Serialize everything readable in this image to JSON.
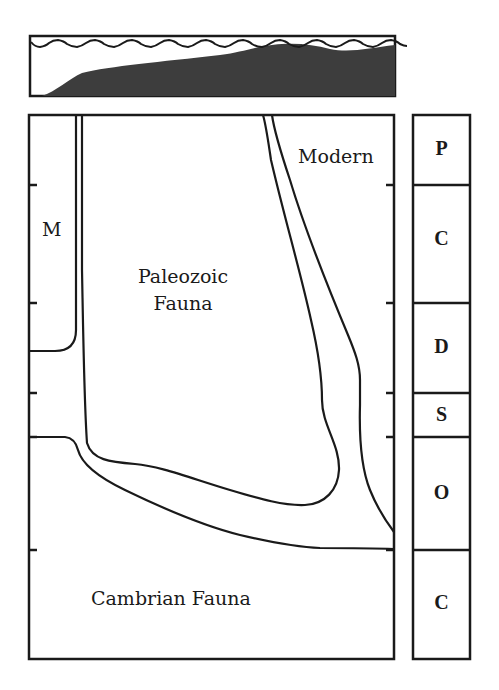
{
  "inset": {
    "description": "sea-level and seafloor profile inset",
    "water_color": "#ffffff",
    "sediment_color": "#3a3a3a"
  },
  "main_diagram": {
    "labels": {
      "modern": "Modern",
      "m": "M",
      "paleozoic_line1": "Paleozoic",
      "paleozoic_line2": "Fauna",
      "cambrian": "Cambrian Fauna"
    }
  },
  "periods": [
    {
      "label": "P",
      "top": 115,
      "bottom": 185
    },
    {
      "label": "C",
      "top": 185,
      "bottom": 303
    },
    {
      "label": "D",
      "top": 303,
      "bottom": 393
    },
    {
      "label": "S",
      "top": 393,
      "bottom": 437
    },
    {
      "label": "O",
      "top": 437,
      "bottom": 550
    },
    {
      "label": "C",
      "top": 550,
      "bottom": 659
    }
  ],
  "colors": {
    "line": "#1a1a1a",
    "background": "#ffffff"
  }
}
